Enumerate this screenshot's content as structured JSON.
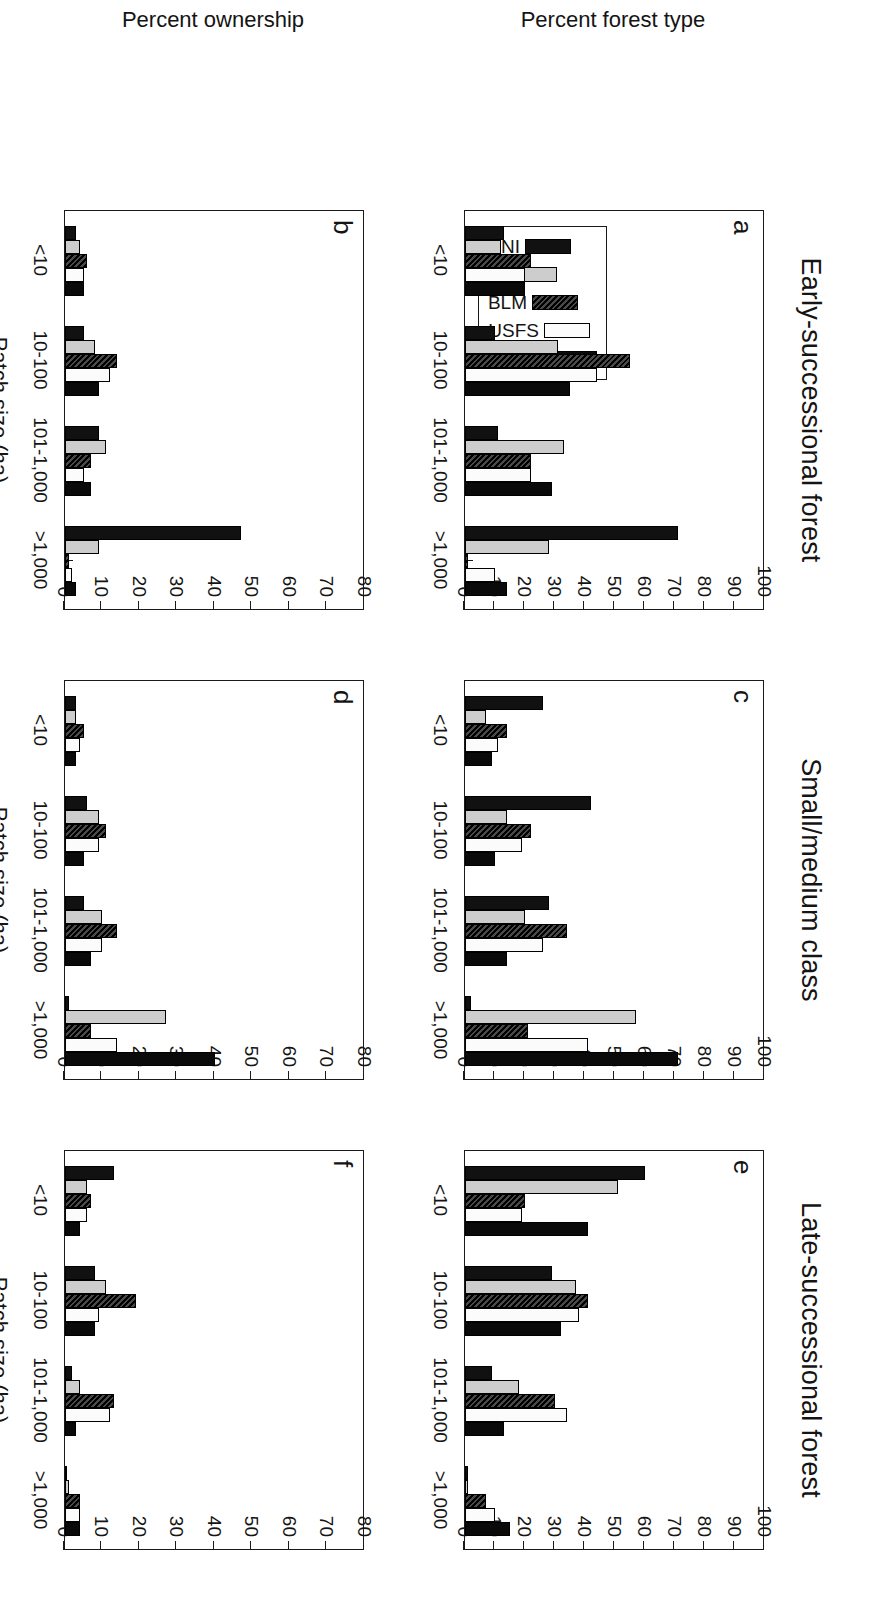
{
  "figure": {
    "column_titles": [
      "Early-successional forest",
      "Small/medium class",
      "Late-successional forest"
    ],
    "row_ylabels": [
      "Percent forest type",
      "Percent ownership"
    ],
    "xlabel": "Patch size (ha)"
  },
  "legend": {
    "items": [
      {
        "key": "PNI",
        "label": "PNI",
        "color": "#111111",
        "style": "s-pni"
      },
      {
        "key": "PI",
        "label": "PI",
        "color": "#cdcdcd",
        "style": "s-pi"
      },
      {
        "key": "BLM",
        "label": "BLM",
        "color": "#2e2e2e",
        "style": "s-blm"
      },
      {
        "key": "USFS",
        "label": "USFS",
        "color": "#fbfbfb",
        "style": "s-usfs"
      },
      {
        "key": "STATE",
        "label": "STATE",
        "color": "#0a0a0a",
        "style": "s-state"
      }
    ]
  },
  "chart_data": [
    {
      "panel": "a",
      "type": "bar",
      "title": "Early-successional forest",
      "xlabel": "Patch size (ha)",
      "ylabel": "Percent forest type",
      "categories": [
        "<10",
        "10-100",
        "101-1,000",
        ">1,000"
      ],
      "ylim": [
        0,
        100
      ],
      "yticks": [
        0,
        10,
        20,
        30,
        40,
        50,
        60,
        70,
        80,
        90,
        100
      ],
      "grid": false,
      "legend_position": "inside-lower-left",
      "series": [
        {
          "name": "PNI",
          "values": [
            13,
            10,
            11,
            71
          ]
        },
        {
          "name": "PI",
          "values": [
            12,
            31,
            33,
            28
          ]
        },
        {
          "name": "BLM",
          "values": [
            22,
            55,
            22,
            1
          ]
        },
        {
          "name": "USFS",
          "values": [
            20,
            44,
            22,
            10
          ]
        },
        {
          "name": "STATE",
          "values": [
            20,
            35,
            29,
            14
          ]
        }
      ]
    },
    {
      "panel": "b",
      "type": "bar",
      "title": "Early-successional forest",
      "xlabel": "Patch size (ha)",
      "ylabel": "Percent ownership",
      "categories": [
        "<10",
        "10-100",
        "101-1,000",
        ">1,000"
      ],
      "ylim": [
        0,
        80
      ],
      "yticks": [
        0,
        10,
        20,
        30,
        40,
        50,
        60,
        70,
        80
      ],
      "grid": false,
      "legend_position": "none",
      "series": [
        {
          "name": "PNI",
          "values": [
            3,
            5,
            9,
            47
          ]
        },
        {
          "name": "PI",
          "values": [
            4,
            8,
            11,
            9
          ]
        },
        {
          "name": "BLM",
          "values": [
            6,
            14,
            7,
            1
          ]
        },
        {
          "name": "USFS",
          "values": [
            5,
            12,
            5,
            2
          ]
        },
        {
          "name": "STATE",
          "values": [
            5,
            9,
            7,
            3
          ]
        }
      ]
    },
    {
      "panel": "c",
      "type": "bar",
      "title": "Small/medium class",
      "xlabel": "Patch size (ha)",
      "ylabel": "Percent forest type",
      "categories": [
        "<10",
        "10-100",
        "101-1,000",
        ">1,000"
      ],
      "ylim": [
        0,
        100
      ],
      "yticks": [
        0,
        10,
        20,
        30,
        40,
        50,
        60,
        70,
        80,
        90,
        100
      ],
      "grid": false,
      "legend_position": "none",
      "series": [
        {
          "name": "PNI",
          "values": [
            26,
            42,
            28,
            2
          ]
        },
        {
          "name": "PI",
          "values": [
            7,
            14,
            20,
            57
          ]
        },
        {
          "name": "BLM",
          "values": [
            14,
            22,
            34,
            21
          ]
        },
        {
          "name": "USFS",
          "values": [
            11,
            19,
            26,
            41
          ]
        },
        {
          "name": "STATE",
          "values": [
            9,
            10,
            14,
            71
          ]
        }
      ]
    },
    {
      "panel": "d",
      "type": "bar",
      "title": "Small/medium class",
      "xlabel": "Patch size (ha)",
      "ylabel": "Percent ownership",
      "categories": [
        "<10",
        "10-100",
        "101-1,000",
        ">1,000"
      ],
      "ylim": [
        0,
        80
      ],
      "yticks": [
        0,
        10,
        20,
        30,
        40,
        50,
        60,
        70,
        80
      ],
      "grid": false,
      "legend_position": "none",
      "series": [
        {
          "name": "PNI",
          "values": [
            3,
            6,
            5,
            1
          ]
        },
        {
          "name": "PI",
          "values": [
            3,
            9,
            10,
            27
          ]
        },
        {
          "name": "BLM",
          "values": [
            5,
            11,
            14,
            7
          ]
        },
        {
          "name": "USFS",
          "values": [
            4,
            9,
            10,
            14
          ]
        },
        {
          "name": "STATE",
          "values": [
            3,
            5,
            7,
            40
          ]
        }
      ]
    },
    {
      "panel": "e",
      "type": "bar",
      "title": "Late-successional forest",
      "xlabel": "Patch size (ha)",
      "ylabel": "Percent forest type",
      "categories": [
        "<10",
        "10-100",
        "101-1,000",
        ">1,000"
      ],
      "ylim": [
        0,
        100
      ],
      "yticks": [
        0,
        10,
        20,
        30,
        40,
        50,
        60,
        70,
        80,
        90,
        100
      ],
      "grid": false,
      "legend_position": "none",
      "series": [
        {
          "name": "PNI",
          "values": [
            60,
            29,
            9,
            1
          ]
        },
        {
          "name": "PI",
          "values": [
            51,
            37,
            18,
            1
          ]
        },
        {
          "name": "BLM",
          "values": [
            20,
            41,
            30,
            7
          ]
        },
        {
          "name": "USFS",
          "values": [
            19,
            38,
            34,
            10
          ]
        },
        {
          "name": "STATE",
          "values": [
            41,
            32,
            13,
            15
          ]
        }
      ]
    },
    {
      "panel": "f",
      "type": "bar",
      "title": "Late-successional forest",
      "xlabel": "Patch size (ha)",
      "ylabel": "Percent ownership",
      "categories": [
        "<10",
        "10-100",
        "101-1,000",
        ">1,000"
      ],
      "ylim": [
        0,
        80
      ],
      "yticks": [
        0,
        10,
        20,
        30,
        40,
        50,
        60,
        70,
        80
      ],
      "grid": false,
      "legend_position": "none",
      "series": [
        {
          "name": "PNI",
          "values": [
            13,
            8,
            2,
            0
          ]
        },
        {
          "name": "PI",
          "values": [
            6,
            11,
            4,
            1
          ]
        },
        {
          "name": "BLM",
          "values": [
            7,
            19,
            13,
            4
          ]
        },
        {
          "name": "USFS",
          "values": [
            6,
            9,
            12,
            4
          ]
        },
        {
          "name": "STATE",
          "values": [
            4,
            8,
            3,
            4
          ]
        }
      ]
    }
  ]
}
